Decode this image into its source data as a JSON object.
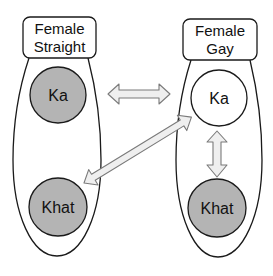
{
  "colors": {
    "stroke": "#1a1a1a",
    "filled_node": "#b4b4b4",
    "empty_node": "#ffffff",
    "arrow_fill": "#efefef",
    "arrow_stroke": "#7a7a7a",
    "background": "#ffffff"
  },
  "groups": [
    {
      "id": "female-straight",
      "label_line1": "Female",
      "label_line2": "Straight",
      "nodes": [
        {
          "id": "ka",
          "label": "Ka",
          "filled": true
        },
        {
          "id": "khat",
          "label": "Khat",
          "filled": true
        }
      ]
    },
    {
      "id": "female-gay",
      "label_line1": "Female",
      "label_line2": "Gay",
      "nodes": [
        {
          "id": "ka",
          "label": "Ka",
          "filled": false
        },
        {
          "id": "khat",
          "label": "Khat",
          "filled": true
        }
      ]
    }
  ],
  "edges": [
    {
      "from": "female-straight.ka",
      "to": "female-gay.ka",
      "type": "bidirectional"
    },
    {
      "from": "female-straight.khat",
      "to": "female-gay.ka",
      "type": "bidirectional"
    },
    {
      "from": "female-gay.ka",
      "to": "female-gay.khat",
      "type": "bidirectional"
    }
  ]
}
